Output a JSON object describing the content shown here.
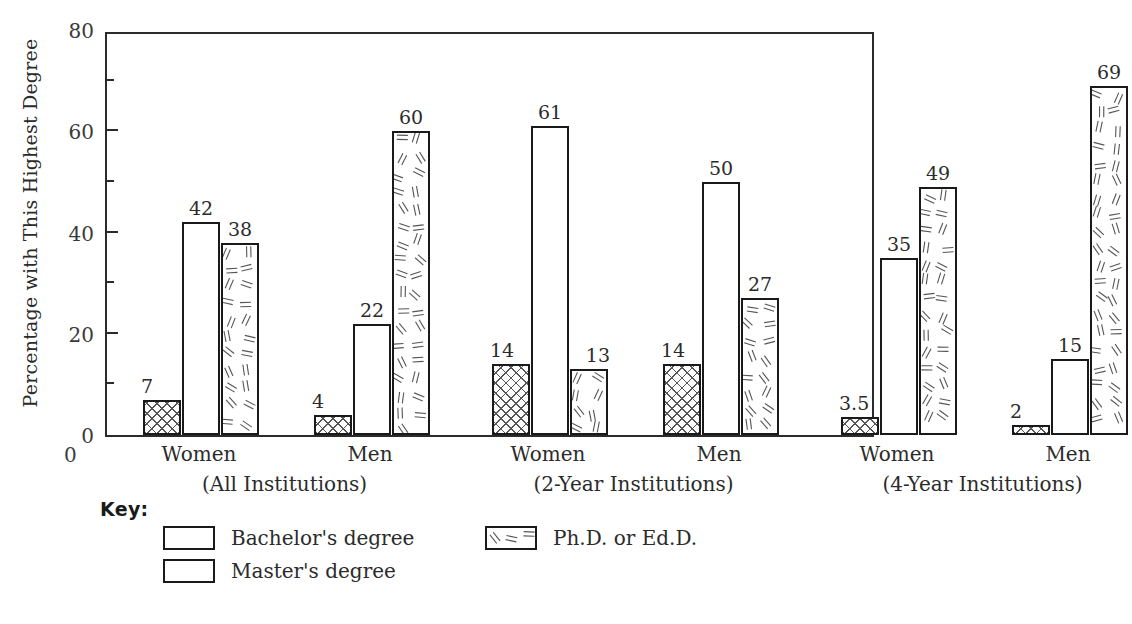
{
  "chart_data": {
    "type": "bar",
    "title": "",
    "xlabel": "",
    "ylabel": "Percentage with This Highest Degree",
    "ylim": [
      0,
      80
    ],
    "yticks": [
      0,
      20,
      40,
      60,
      80
    ],
    "yticks_minor": [
      10,
      30,
      50,
      70
    ],
    "grid": false,
    "legend_position": "below-left",
    "origin_label": "0",
    "categories": [
      "Women",
      "Men",
      "Women",
      "Men",
      "Women",
      "Men"
    ],
    "group_labels": [
      "(All Institutions)",
      "(2-Year Institutions)",
      "(4-Year Institutions)"
    ],
    "series": [
      {
        "name": "Bachelor's degree",
        "pattern": "crosshatch",
        "values": [
          7,
          4,
          14,
          14,
          3.5,
          2
        ],
        "value_labels": [
          "7",
          "4",
          "14",
          "14",
          "3.5",
          "2"
        ]
      },
      {
        "name": "Master's degree",
        "pattern": "white",
        "values": [
          42,
          22,
          61,
          50,
          35,
          15
        ],
        "value_labels": [
          "42",
          "22",
          "61",
          "50",
          "35",
          "15"
        ]
      },
      {
        "name": "Ph.D. or Ed.D.",
        "pattern": "dashes",
        "values": [
          38,
          60,
          13,
          27,
          49,
          69
        ],
        "value_labels": [
          "38",
          "60",
          "13",
          "27",
          "49",
          "69"
        ]
      }
    ]
  },
  "axis": {
    "y_title": "Percentage with This Highest Degree",
    "y_tick_labels": [
      "80",
      "60",
      "40",
      "20",
      "0"
    ],
    "origin_zero": "0"
  },
  "groups": [
    {
      "cluster_label": "(All Institutions)",
      "subgroups": [
        {
          "label": "Women",
          "bars": [
            {
              "series": "Bachelor's degree",
              "value": 7,
              "label": "7"
            },
            {
              "series": "Master's degree",
              "value": 42,
              "label": "42"
            },
            {
              "series": "Ph.D. or Ed.D.",
              "value": 38,
              "label": "38"
            }
          ]
        },
        {
          "label": "Men",
          "bars": [
            {
              "series": "Bachelor's degree",
              "value": 4,
              "label": "4"
            },
            {
              "series": "Master's degree",
              "value": 22,
              "label": "22"
            },
            {
              "series": "Ph.D. or Ed.D.",
              "value": 60,
              "label": "60"
            }
          ]
        }
      ]
    },
    {
      "cluster_label": "(2-Year Institutions)",
      "subgroups": [
        {
          "label": "Women",
          "bars": [
            {
              "series": "Bachelor's degree",
              "value": 14,
              "label": "14"
            },
            {
              "series": "Master's degree",
              "value": 61,
              "label": "61"
            },
            {
              "series": "Ph.D. or Ed.D.",
              "value": 13,
              "label": "13"
            }
          ]
        },
        {
          "label": "Men",
          "bars": [
            {
              "series": "Bachelor's degree",
              "value": 14,
              "label": "14"
            },
            {
              "series": "Master's degree",
              "value": 50,
              "label": "50"
            },
            {
              "series": "Ph.D. or Ed.D.",
              "value": 27,
              "label": "27"
            }
          ]
        }
      ]
    },
    {
      "cluster_label": "(4-Year Institutions)",
      "subgroups": [
        {
          "label": "Women",
          "bars": [
            {
              "series": "Bachelor's degree",
              "value": 3.5,
              "label": "3.5"
            },
            {
              "series": "Master's degree",
              "value": 35,
              "label": "35"
            },
            {
              "series": "Ph.D. or Ed.D.",
              "value": 49,
              "label": "49"
            }
          ]
        },
        {
          "label": "Men",
          "bars": [
            {
              "series": "Bachelor's degree",
              "value": 2,
              "label": "2"
            },
            {
              "series": "Master's degree",
              "value": 15,
              "label": "15"
            },
            {
              "series": "Ph.D. or Ed.D.",
              "value": 69,
              "label": "69"
            }
          ]
        }
      ]
    }
  ],
  "key": {
    "title": "Key:",
    "entries": [
      {
        "label": "Bachelor's degree",
        "pattern": "crosshatch"
      },
      {
        "label": "Master's degree",
        "pattern": "white"
      },
      {
        "label": "Ph.D. or Ed.D.",
        "pattern": "dashes"
      }
    ]
  },
  "colors": {
    "ink": "#2b2b2b",
    "bar_outline": "#1a1a1a",
    "pattern": "#555555",
    "background": "#ffffff"
  }
}
